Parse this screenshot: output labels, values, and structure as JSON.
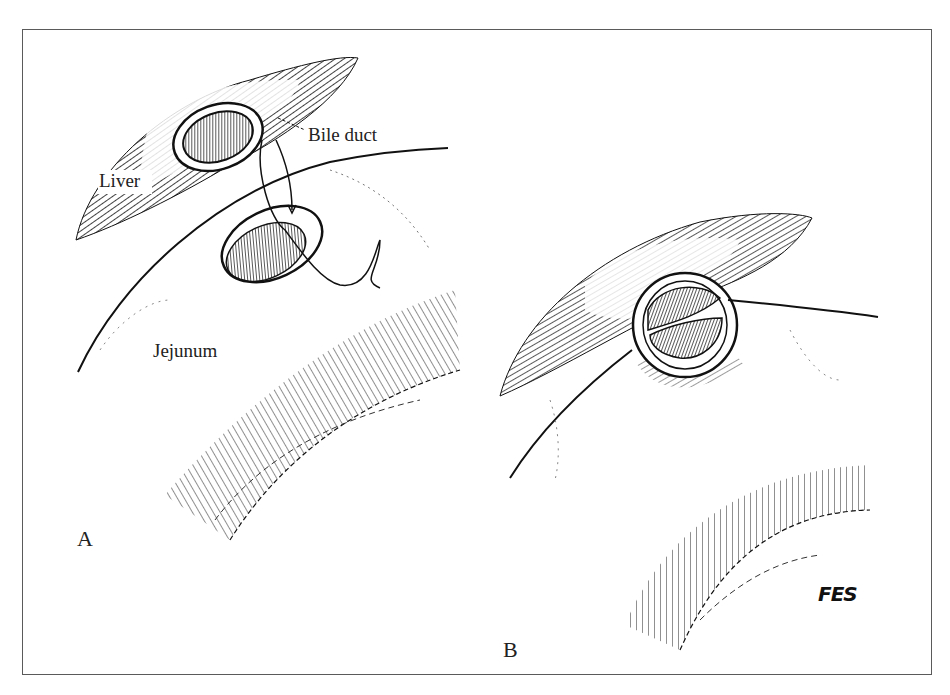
{
  "figure": {
    "type": "surgical illustration (pen and ink)",
    "panels": [
      {
        "id": "A",
        "label": "A",
        "annotations": [
          "Liver",
          "Bile duct",
          "Jejunum"
        ]
      },
      {
        "id": "B",
        "label": "B",
        "annotations": []
      }
    ],
    "labels": {
      "liver": "Liver",
      "bile_duct": "Bile duct",
      "jejunum": "Jejunum",
      "panel_a": "A",
      "panel_b": "B",
      "signature": "FES"
    },
    "colors": {
      "ink": "#111111",
      "frame": "#5a5a5a",
      "background": "#ffffff"
    }
  }
}
